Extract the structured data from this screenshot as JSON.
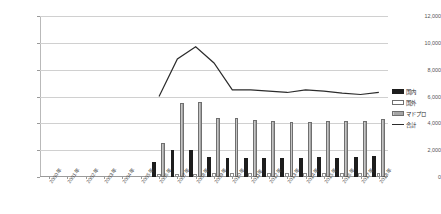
{
  "title": "",
  "legend": {
    "position": "right",
    "items": [
      {
        "label": "国内",
        "key": "kokunai",
        "color": "#1d1d1d",
        "style": "bar"
      },
      {
        "label": "国外",
        "key": "kokugai",
        "color": "#ffffff",
        "style": "bar"
      },
      {
        "label": "マドプロ",
        "key": "madopro",
        "color": "#a6a6a6",
        "style": "bar"
      },
      {
        "label": "合計",
        "key": "goukei",
        "color": "#2b2b2b",
        "style": "line"
      }
    ]
  },
  "chart_data": {
    "type": "bar",
    "title": "",
    "xlabel": "",
    "ylabel": "",
    "ylim": [
      0,
      12000
    ],
    "ytick_step": 2000,
    "ytick_labels": [
      "12,000",
      "10,000",
      "8,000",
      "6,000",
      "4,000",
      "2,000",
      "0"
    ],
    "grid": true,
    "legend_position": "right",
    "categories": [
      "2000年",
      "2001年",
      "2002年",
      "2003年",
      "2004年",
      "2005年",
      "2006年",
      "2007年",
      "2008年",
      "2009年",
      "2010年",
      "2011年",
      "2012年",
      "2013年",
      "2014年",
      "2015年",
      "2016年",
      "2017年",
      "2018年"
    ],
    "series": [
      {
        "name": "国内",
        "type": "bar",
        "color": "#1d1d1d",
        "values": [
          0,
          0,
          0,
          0,
          0,
          0,
          1100,
          2000,
          2050,
          1500,
          1450,
          1450,
          1450,
          1400,
          1400,
          1500,
          1450,
          1500,
          1550
        ]
      },
      {
        "name": "国外",
        "type": "bar",
        "color": "#ffffff",
        "values": [
          0,
          0,
          0,
          0,
          0,
          0,
          200,
          250,
          250,
          300,
          280,
          280,
          280,
          280,
          280,
          300,
          300,
          300,
          300
        ]
      },
      {
        "name": "マドプロ",
        "type": "bar",
        "color": "#a6a6a6",
        "values": [
          0,
          0,
          0,
          0,
          0,
          0,
          2500,
          5500,
          5600,
          4400,
          4400,
          4250,
          4200,
          4100,
          4100,
          4150,
          4150,
          4200,
          4300
        ]
      },
      {
        "name": "合計",
        "type": "line",
        "color": "#2b2b2b",
        "values": [
          null,
          null,
          null,
          null,
          null,
          null,
          6000,
          8800,
          9700,
          8500,
          6500,
          6500,
          6400,
          6300,
          6500,
          6400,
          6250,
          6150,
          6300
        ]
      }
    ]
  }
}
